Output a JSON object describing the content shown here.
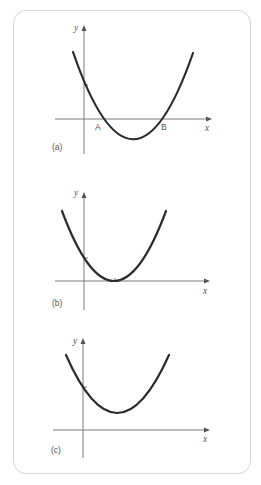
{
  "figure": {
    "graphs": [
      {
        "id": "a",
        "label": "(a)",
        "x_axis_label": "x",
        "y_axis_label": "y",
        "points": [
          {
            "name": "A"
          },
          {
            "name": "B"
          }
        ],
        "description": "Parabola crossing the x-axis at two points A and B"
      },
      {
        "id": "b",
        "label": "(b)",
        "x_axis_label": "x",
        "y_axis_label": "y",
        "description": "Parabola touching the x-axis at one point"
      },
      {
        "id": "c",
        "label": "(c)",
        "x_axis_label": "x",
        "y_axis_label": "y",
        "description": "Parabola entirely above the x-axis"
      }
    ]
  },
  "colors": {
    "curve": "#2b2b2b",
    "axis": "#7a7a7a",
    "border": "#d6d6d6"
  }
}
